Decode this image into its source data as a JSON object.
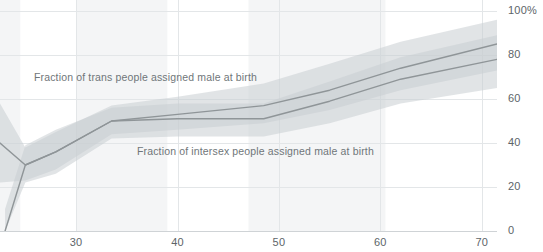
{
  "chart_data": {
    "type": "line",
    "title": "",
    "xlabel": "",
    "ylabel": "",
    "xlim": [
      22.5,
      71.5
    ],
    "ylim": [
      0,
      100
    ],
    "grid": true,
    "legend_position": "inline-annotations",
    "x_ticks": [
      30,
      40,
      50,
      60,
      70
    ],
    "x_tick_labels": [
      "30",
      "40",
      "50",
      "60",
      "70"
    ],
    "y_ticks": [
      0,
      20,
      40,
      60,
      80,
      100
    ],
    "y_tick_labels": [
      "0",
      "20",
      "40",
      "60",
      "80",
      "100%"
    ],
    "series": [
      {
        "name": "Fraction of trans people assigned male at birth",
        "color": "#8f9598",
        "band_color": "#c9ced1",
        "x": [
          22.5,
          25,
          28,
          33.5,
          40,
          48.5,
          55,
          62,
          71.5
        ],
        "values": [
          40,
          30,
          36,
          50,
          53,
          57,
          64,
          74,
          85
        ],
        "band_low": [
          22,
          23,
          28,
          44,
          46,
          49,
          55,
          64,
          73
        ],
        "band_high": [
          58,
          38,
          45,
          57,
          61,
          67,
          76,
          86,
          96
        ]
      },
      {
        "name": "Fraction of intersex people assigned male at birth",
        "color": "#8f9598",
        "band_color": "#c9ced1",
        "x": [
          23,
          25,
          28,
          33.5,
          40,
          48.5,
          55,
          62,
          71.5
        ],
        "values": [
          0,
          30,
          36,
          50,
          51,
          51,
          59,
          69,
          78
        ],
        "band_low": [
          0,
          22,
          26,
          42,
          43,
          43,
          49,
          58,
          65
        ],
        "band_high": [
          10,
          39,
          46,
          56,
          58,
          58,
          68,
          79,
          89
        ]
      }
    ],
    "shaded_x_bands": [
      {
        "from": 22.5,
        "to": 24.5
      },
      {
        "from": 30.0,
        "to": 39.0
      },
      {
        "from": 47.0,
        "to": 60.5
      }
    ],
    "annotations": [
      {
        "text": "Fraction of trans people assigned male at birth",
        "x": 23.6,
        "y": 62.5
      },
      {
        "text": "Fraction of intersex people assigned male at birth",
        "x": 34.2,
        "y": 29.5
      }
    ]
  }
}
